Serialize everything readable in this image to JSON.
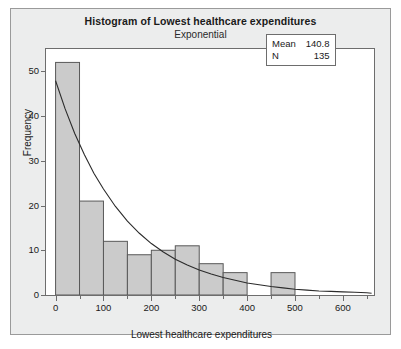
{
  "chart_data": {
    "type": "bar",
    "title": "Histogram of Lowest healthcare expenditures",
    "subtitle": "Exponential",
    "xlabel": "Lowest healthcare expenditures",
    "ylabel": "Frequency",
    "xlim": [
      -20,
      665
    ],
    "ylim": [
      0,
      55
    ],
    "grid": false,
    "bin_width": 50,
    "bin_starts": [
      0,
      50,
      100,
      150,
      200,
      250,
      300,
      350,
      400,
      450
    ],
    "categories": [
      "0-50",
      "50-100",
      "100-150",
      "150-200",
      "200-250",
      "250-300",
      "300-350",
      "350-400",
      "400-450",
      "450-500"
    ],
    "values": [
      52,
      21,
      12,
      9,
      10,
      11,
      7,
      5,
      0,
      5
    ],
    "xticks": [
      0,
      100,
      200,
      300,
      400,
      500,
      600
    ],
    "xtick_labels": [
      "0",
      "100",
      "200",
      "300",
      "400",
      "500",
      "600"
    ],
    "xminor_ticks": [
      50,
      150,
      250,
      350,
      450,
      550,
      650
    ],
    "yticks": [
      0,
      10,
      20,
      30,
      40,
      50
    ],
    "ytick_labels": [
      "0",
      "10",
      "20",
      "30",
      "40",
      "50"
    ],
    "series": [
      {
        "name": "Histogram",
        "kind": "bar",
        "values": [
          52,
          21,
          12,
          9,
          10,
          11,
          7,
          5,
          0,
          5
        ],
        "fill_color": "#cbcbcb",
        "edge_color": "#595959"
      },
      {
        "name": "Exponential fit",
        "kind": "line",
        "color": "#2b2b2b",
        "distribution": "exponential",
        "mean": 140.8,
        "x": [
          0,
          20,
          40,
          60,
          80,
          100,
          125,
          150,
          175,
          200,
          225,
          250,
          275,
          300,
          325,
          350,
          375,
          400,
          425,
          450,
          475,
          500,
          525,
          550,
          575,
          600,
          625,
          650,
          660
        ],
        "y": [
          47.9,
          41.6,
          36.1,
          31.4,
          27.2,
          23.7,
          19.8,
          16.5,
          13.8,
          11.5,
          9.6,
          8.0,
          6.7,
          5.6,
          4.7,
          3.9,
          3.3,
          2.7,
          2.3,
          1.9,
          1.6,
          1.3,
          1.1,
          0.9,
          0.8,
          0.7,
          0.6,
          0.5,
          0.4
        ]
      }
    ],
    "annotations": {
      "stats_box": {
        "rows": [
          {
            "key": "Mean",
            "value": "140.8"
          },
          {
            "key": "N",
            "value": "135"
          }
        ]
      }
    },
    "colors": {
      "bar_fill": "#cbcbcb",
      "bar_edge": "#595959",
      "curve": "#2b2b2b",
      "panel_bg": "#eceded",
      "plot_bg": "#ffffff",
      "frame": "#6d6d6d",
      "text": "#1a1a1a"
    }
  }
}
